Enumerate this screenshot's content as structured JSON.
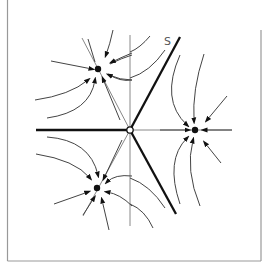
{
  "diagram": {
    "title": "",
    "type": "phase-portrait",
    "labels": {
      "separatrix": "S"
    },
    "saddle": {
      "x": 130,
      "y": 130
    },
    "nodes": [
      {
        "name": "upper-left-node",
        "x": 98,
        "y": 69
      },
      {
        "name": "lower-left-node",
        "x": 97,
        "y": 188
      },
      {
        "name": "right-node",
        "x": 195,
        "y": 130
      }
    ],
    "colors": {
      "line": "#111111",
      "thin": "#777777",
      "frame": "#999999",
      "curve": "#444444"
    }
  }
}
